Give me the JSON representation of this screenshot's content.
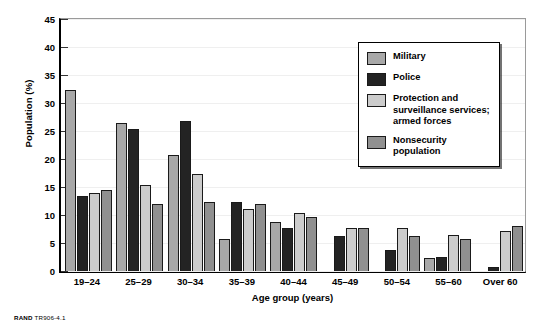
{
  "chart_data": {
    "type": "bar",
    "title": "",
    "xlabel": "Age group (years)",
    "ylabel": "Population (%)",
    "ylim": [
      0,
      45
    ],
    "yticks": [
      0,
      5,
      10,
      15,
      20,
      25,
      30,
      35,
      40,
      45
    ],
    "grid": false,
    "legend_position": "upper right",
    "categories": [
      "19–24",
      "25–29",
      "30–34",
      "35–39",
      "40–44",
      "45–49",
      "50–54",
      "55–60",
      "Over 60"
    ],
    "series": [
      {
        "name": "Military",
        "color": "#a8a8a8",
        "values": [
          32.4,
          26.5,
          20.7,
          5.8,
          8.7,
          0,
          0,
          2.3,
          0
        ]
      },
      {
        "name": "Police",
        "color": "#232323",
        "values": [
          13.4,
          25.3,
          26.7,
          12.3,
          7.7,
          6.3,
          3.7,
          2.5,
          0.8
        ]
      },
      {
        "name": "Protection and\nsurveillance services;\narmed forces",
        "color": "#cccccc",
        "values": [
          14.0,
          15.4,
          17.3,
          11.0,
          10.3,
          7.7,
          7.7,
          6.5,
          7.2
        ]
      },
      {
        "name": "Nonsecurity\npopulation",
        "color": "#909090",
        "values": [
          14.5,
          12.0,
          12.3,
          12.0,
          9.6,
          7.7,
          6.2,
          5.8,
          8.1
        ]
      }
    ]
  },
  "footer": {
    "brand": "RAND",
    "code": "TR906-4.1"
  }
}
